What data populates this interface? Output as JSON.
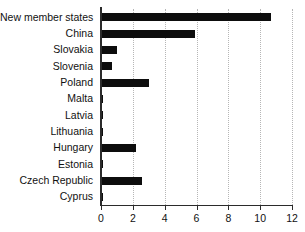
{
  "chart_data": {
    "type": "bar",
    "orientation": "horizontal",
    "title": "",
    "subtitle": "",
    "xlabel": "",
    "ylabel": "",
    "categories": [
      "New member states",
      "China",
      "Slovakia",
      "Slovenia",
      "Poland",
      "Malta",
      "Latvia",
      "Lithuania",
      "Hungary",
      "Estonia",
      "Czech Republic",
      "Cyprus"
    ],
    "values": [
      10.7,
      5.9,
      1.0,
      0.7,
      3.0,
      0.1,
      0.1,
      0.15,
      2.2,
      0.15,
      2.55,
      0.1
    ],
    "xlim": [
      0,
      12
    ],
    "xticks": [
      0,
      2,
      4,
      6,
      8,
      10,
      12
    ],
    "xtick_labels": [
      "0",
      "2",
      "4",
      "6",
      "8",
      "10",
      "12"
    ],
    "grid": "vertical-dotted",
    "legend": "none",
    "bar_color": "#0d0d0d",
    "axis_color": "#2b2b2b",
    "grid_color": "#b6b6b6",
    "background_color": "#ffffff"
  }
}
